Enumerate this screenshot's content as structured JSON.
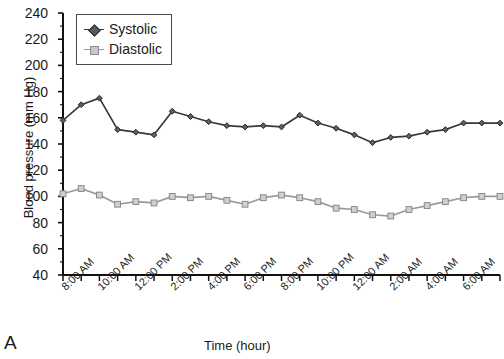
{
  "panel": {
    "label": "A"
  },
  "axes": {
    "x_title": "Time (hour)",
    "y_title": "Blood pressure (mm Hg)",
    "y_ticks": [
      "240",
      "220",
      "200",
      "180",
      "160",
      "140",
      "120",
      "100",
      "80",
      "60",
      "40"
    ],
    "x_ticks": [
      "8:00 AM",
      "10:00 AM",
      "12:00 PM",
      "2:00 PM",
      "4:00 PM",
      "6:00 PM",
      "8:00 PM",
      "10:00 PM",
      "12:00 AM",
      "2:00 AM",
      "4:00 AM",
      "6:00 AM"
    ]
  },
  "legend": {
    "position": "top-left-inside",
    "entries": [
      {
        "label": "Systolic",
        "color": "#3a3a3a",
        "marker": "diamond"
      },
      {
        "label": "Diastolic",
        "color": "#9a9a9a",
        "marker": "square"
      }
    ]
  },
  "colors": {
    "systolic": "#3a3a3a",
    "diastolic": "#9a9a9a",
    "axis": "#111111",
    "background": "#ffffff"
  },
  "chart_data": {
    "type": "line",
    "title": "",
    "xlabel": "Time (hour)",
    "ylabel": "Blood pressure (mm Hg)",
    "ylim": [
      40,
      240
    ],
    "ytick_step": 20,
    "grid": false,
    "x": [
      "8:00 AM",
      "9:00 AM",
      "10:00 AM",
      "11:00 AM",
      "12:00 PM",
      "1:00 PM",
      "2:00 PM",
      "3:00 PM",
      "4:00 PM",
      "5:00 PM",
      "6:00 PM",
      "7:00 PM",
      "8:00 PM",
      "9:00 PM",
      "10:00 PM",
      "11:00 PM",
      "12:00 AM",
      "1:00 AM",
      "2:00 AM",
      "3:00 AM",
      "4:00 AM",
      "5:00 AM",
      "6:00 AM",
      "7:00 AM",
      "8:00 AM"
    ],
    "x_tick_labels": [
      "8:00 AM",
      "10:00 AM",
      "12:00 PM",
      "2:00 PM",
      "4:00 PM",
      "6:00 PM",
      "8:00 PM",
      "10:00 PM",
      "12:00 AM",
      "2:00 AM",
      "4:00 AM",
      "6:00 AM"
    ],
    "series": [
      {
        "name": "Systolic",
        "color": "#3a3a3a",
        "marker": "diamond",
        "values": [
          158,
          170,
          175,
          151,
          149,
          147,
          165,
          161,
          157,
          154,
          153,
          154,
          153,
          162,
          156,
          152,
          147,
          141,
          145,
          146,
          149,
          151,
          156,
          156,
          156
        ]
      },
      {
        "name": "Diastolic",
        "color": "#9a9a9a",
        "marker": "square",
        "values": [
          102,
          106,
          101,
          94,
          96,
          95,
          100,
          99,
          100,
          97,
          94,
          99,
          101,
          99,
          96,
          91,
          90,
          86,
          85,
          90,
          93,
          96,
          99,
          100,
          100
        ]
      }
    ]
  }
}
